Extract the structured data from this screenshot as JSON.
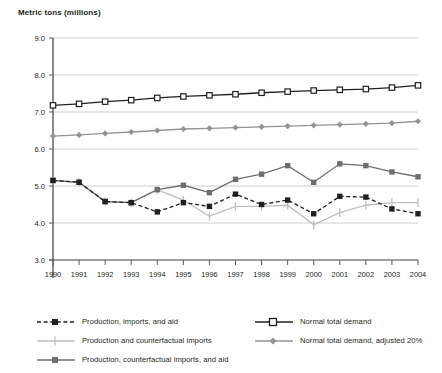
{
  "chart_data": {
    "type": "line",
    "title": "Metric tons (millions)",
    "xlabel": "",
    "ylabel": "Metric tons (millions)",
    "grid": true,
    "legend_position": "bottom",
    "xlim": [
      1990,
      2004
    ],
    "ylim": [
      3.0,
      9.0
    ],
    "ytick_step": 1.0,
    "categories": [
      1990,
      1991,
      1992,
      1993,
      1994,
      1995,
      1996,
      1997,
      1998,
      1999,
      2000,
      2001,
      2002,
      2003,
      2004
    ],
    "xticklabels": [
      "1990",
      "1991",
      "1992",
      "1993",
      "1994",
      "1995",
      "1996",
      "1997",
      "1998",
      "1999",
      "2000",
      "2001",
      "2002",
      "2003",
      "2004"
    ],
    "yticklabels": [
      "9.0",
      "8.0",
      "7.0",
      "6.0",
      "5.0",
      "4.0",
      "3.0"
    ],
    "yticks": [
      9.0,
      8.0,
      7.0,
      6.0,
      5.0,
      4.0,
      3.0
    ],
    "series": [
      {
        "name": "Production, imports, and aid",
        "key": "production_imports_aid",
        "color": "#231f20",
        "marker": "filled-square",
        "dash": "dashed",
        "values": [
          5.15,
          5.1,
          4.58,
          4.55,
          4.3,
          4.55,
          4.45,
          4.78,
          4.5,
          4.62,
          4.25,
          4.72,
          4.7,
          4.38,
          4.25
        ]
      },
      {
        "name": "Production and counterfactual imports",
        "key": "production_counterfactual_imports",
        "color": "#bcbec0",
        "marker": "vertical-tick",
        "dash": "solid",
        "values": [
          5.15,
          5.1,
          4.58,
          4.55,
          4.9,
          4.62,
          4.18,
          4.45,
          4.45,
          4.48,
          3.95,
          4.28,
          4.48,
          4.55,
          4.55
        ]
      },
      {
        "name": "Production, counterfactual imports, and aid",
        "key": "production_counterfactual_imports_aid",
        "color": "#6d6e71",
        "marker": "filled-square",
        "dash": "solid",
        "values": [
          5.15,
          5.1,
          4.58,
          4.55,
          4.9,
          5.02,
          4.82,
          5.18,
          5.32,
          5.55,
          5.1,
          5.6,
          5.55,
          5.38,
          5.25
        ]
      },
      {
        "name": "Normal total demand",
        "key": "normal_total_demand",
        "color": "#231f20",
        "marker": "open-square",
        "dash": "solid",
        "values": [
          7.18,
          7.22,
          7.28,
          7.32,
          7.38,
          7.42,
          7.45,
          7.48,
          7.52,
          7.55,
          7.58,
          7.6,
          7.62,
          7.66,
          7.72
        ]
      },
      {
        "name": "Normal total demand, adjusted 20%",
        "key": "normal_total_demand_adjusted_20",
        "color": "#929497",
        "marker": "diamond",
        "dash": "solid",
        "values": [
          6.35,
          6.38,
          6.42,
          6.46,
          6.5,
          6.54,
          6.56,
          6.58,
          6.6,
          6.62,
          6.64,
          6.66,
          6.68,
          6.7,
          6.75
        ]
      }
    ]
  },
  "legend": {
    "left_items": [
      "Production, imports, and aid",
      "Production and counterfactual imports",
      "Production, counterfactual imports, and aid"
    ],
    "right_items": [
      "Normal total demand",
      "Normal total demand, adjusted 20%"
    ]
  }
}
